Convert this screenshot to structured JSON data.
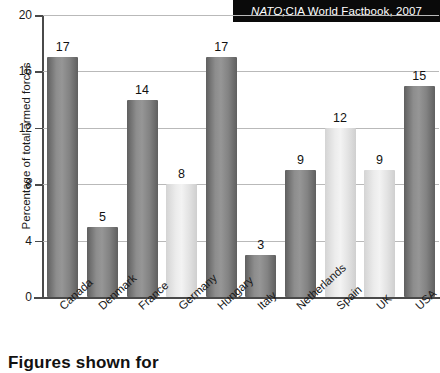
{
  "source_note": {
    "italic_part": "NATO;",
    "rest_part": " CIA World Factbook, 2007",
    "full": "NATO; CIA World Factbook, 2007"
  },
  "bottom_caption": "Figures shown for",
  "colors": {
    "dark_bar": "#7e7e7e",
    "dark_bar_edge": "#5f5f5f",
    "light_bar": "#e2e2e2",
    "light_bar_edge": "#c8c8c8",
    "axis": "#4a4a4a",
    "grid": "#b9b9b9",
    "banner_bg": "#0a0a0a",
    "banner_text": "#ffffff",
    "text": "#1a1a1a"
  },
  "chart_data": {
    "type": "bar",
    "title": "",
    "subtitle": "",
    "xlabel": "",
    "ylabel": "Percentage of total armed forces",
    "ylim": [
      0,
      20
    ],
    "yticks": [
      0,
      4,
      8,
      12,
      16,
      20
    ],
    "ytick_labels": [
      "0",
      "4",
      "8",
      "12",
      "16",
      "20"
    ],
    "grid": true,
    "legend": false,
    "categories": [
      "Canada",
      "Denmark",
      "France",
      "Germany",
      "Hungary",
      "Italy",
      "Netherlands",
      "Spain",
      "UK",
      "USA"
    ],
    "values": [
      17,
      5,
      14,
      8,
      17,
      3,
      9,
      12,
      9,
      15
    ],
    "value_labels": [
      "17",
      "5",
      "14",
      "8",
      "17",
      "3",
      "9",
      "12",
      "9",
      "15"
    ],
    "bar_shades": [
      "dark",
      "dark",
      "dark",
      "light",
      "dark",
      "dark",
      "dark",
      "light",
      "light",
      "dark"
    ],
    "source": "NATO; CIA World Factbook, 2007"
  }
}
